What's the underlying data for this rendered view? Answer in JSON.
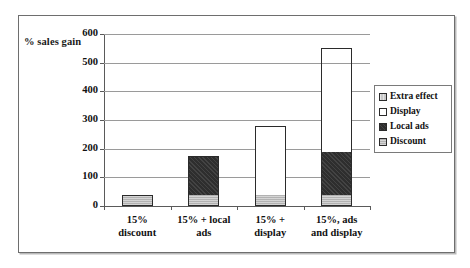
{
  "axis_label": "% sales gain",
  "legend": {
    "items": [
      {
        "label": "Extra effect",
        "key": "extra",
        "color": "#c9c9c9"
      },
      {
        "label": "Display",
        "key": "display",
        "color": "#ffffff"
      },
      {
        "label": "Local ads",
        "key": "localads",
        "color": "#2e2e2e"
      },
      {
        "label": "Discount",
        "key": "discount",
        "color": "#b2b2b2"
      }
    ]
  },
  "chart_data": {
    "type": "bar",
    "title": "",
    "subtitle": "",
    "xlabel": "",
    "ylabel": "% sales gain",
    "ylim": [
      0,
      600
    ],
    "yticks": [
      0,
      100,
      200,
      300,
      400,
      500,
      600
    ],
    "ytick_labels": [
      "0",
      "100",
      "200",
      "300",
      "400",
      "500",
      "600"
    ],
    "grid": true,
    "stacked": true,
    "legend_position": "right",
    "categories": [
      "15% discount",
      "15% + local ads",
      "15% + display",
      "15%, ads and display"
    ],
    "category_lines": [
      [
        "15%",
        "discount"
      ],
      [
        "15% + local",
        "ads"
      ],
      [
        "15% +",
        "display"
      ],
      [
        "15%, ads",
        "and display"
      ]
    ],
    "series": [
      {
        "name": "Discount",
        "color": "#b2b2b2",
        "values": [
          40,
          40,
          40,
          40
        ]
      },
      {
        "name": "Local ads",
        "color": "#2e2e2e",
        "values": [
          0,
          135,
          0,
          150
        ]
      },
      {
        "name": "Display",
        "color": "#ffffff",
        "values": [
          0,
          0,
          240,
          230
        ]
      },
      {
        "name": "Extra effect",
        "color": "#c9c9c9",
        "values": [
          0,
          0,
          0,
          130
        ]
      }
    ],
    "totals": [
      40,
      175,
      280,
      550
    ]
  }
}
